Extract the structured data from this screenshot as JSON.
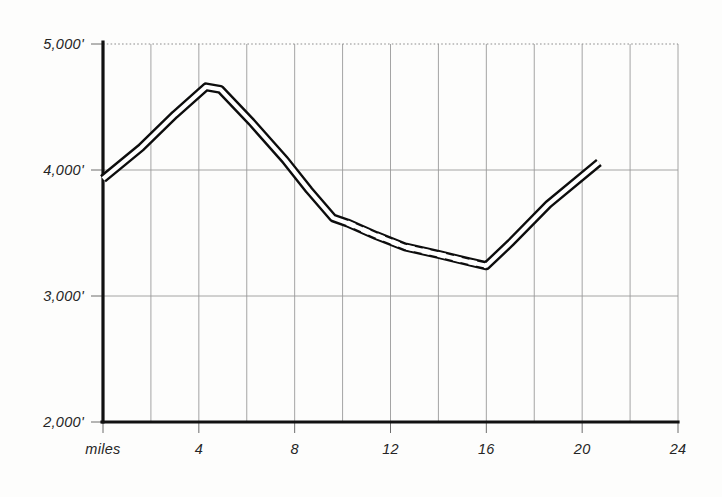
{
  "chart_data": {
    "type": "line",
    "title": "",
    "subtitle": "",
    "xlabel": "miles",
    "ylabel": "",
    "xlim": [
      0,
      24
    ],
    "ylim": [
      2000,
      5000
    ],
    "grid": true,
    "legend_position": "none",
    "x_ticks": [
      {
        "value": 0,
        "label": "miles"
      },
      {
        "value": 4,
        "label": "4"
      },
      {
        "value": 8,
        "label": "8"
      },
      {
        "value": 12,
        "label": "12"
      },
      {
        "value": 16,
        "label": "16"
      },
      {
        "value": 20,
        "label": "20"
      },
      {
        "value": 24,
        "label": "24"
      }
    ],
    "x_gridline_values": [
      2,
      4,
      6,
      8,
      10,
      12,
      14,
      16,
      18,
      20,
      22,
      24
    ],
    "y_ticks": [
      {
        "value": 5000,
        "label": "5,000'"
      },
      {
        "value": 4000,
        "label": "4,000'"
      },
      {
        "value": 3000,
        "label": "3,000'"
      },
      {
        "value": 2000,
        "label": "2,000'"
      }
    ],
    "series": [
      {
        "name": "elevation-profile",
        "style": "double-line-band",
        "units": "feet",
        "x": [
          0.0,
          1.6,
          3.0,
          4.3,
          4.9,
          6.2,
          7.6,
          8.6,
          9.6,
          10.2,
          11.4,
          12.6,
          14.0,
          15.3,
          16.0,
          17.0,
          18.6,
          20.7
        ],
        "values": [
          3930,
          4180,
          4440,
          4660,
          4640,
          4380,
          4080,
          3840,
          3620,
          3580,
          3480,
          3390,
          3330,
          3270,
          3240,
          3420,
          3730,
          4060
        ],
        "dashed_segment": {
          "from_x": 10.2,
          "to_x": 16.0,
          "note": "dashed/stippled portion of route"
        }
      }
    ],
    "annotations": []
  },
  "figure": {
    "paper_color": "#fdfdfc",
    "ink_color": "#0d0d0d",
    "grid_color": "#9a9a9a"
  }
}
